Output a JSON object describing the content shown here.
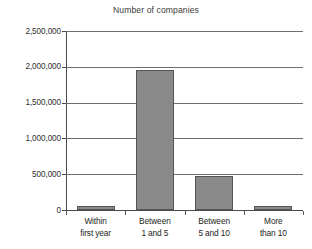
{
  "chart_data": {
    "type": "bar",
    "title": "Number of companies",
    "xlabel": "",
    "ylabel": "",
    "categories": [
      "Within first year",
      "Between 1 and 5",
      "Between 5 and 10",
      "More than 10"
    ],
    "category_lines": [
      [
        "Within",
        "first year"
      ],
      [
        "Between",
        "1 and 5"
      ],
      [
        "Between",
        "5 and 10"
      ],
      [
        "More",
        "than 10"
      ]
    ],
    "values": [
      60000,
      1950000,
      470000,
      50000
    ],
    "ylim": [
      0,
      2500000
    ],
    "ytick_values": [
      2500000,
      2000000,
      1500000,
      1000000,
      500000,
      0
    ],
    "ytick_labels": [
      "2,500,000",
      "2,000,000",
      "1,500,000",
      "1,000,000",
      "500,000",
      "0"
    ],
    "grid": true,
    "grid_axis": "y",
    "legend": "none",
    "bar_fill_color": "#8a8a8a",
    "bar_border_color": "#555555",
    "gridline_color": "#6f6f6f",
    "axis_color": "#4a4a4a",
    "background_color": "#ffffff"
  }
}
